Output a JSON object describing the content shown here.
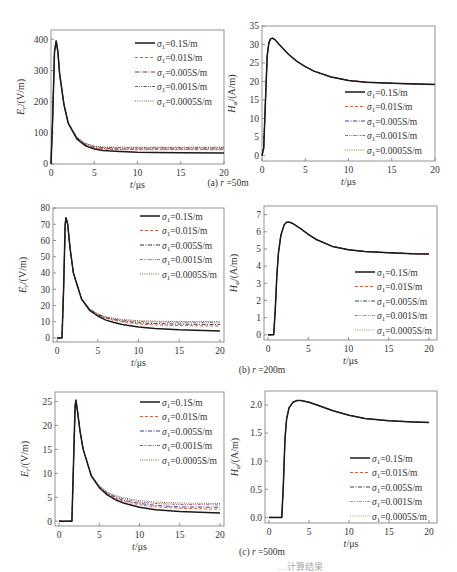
{
  "figure_caption_partial": "…计算结果",
  "chart_data": [
    {
      "id": "a-left",
      "type": "line",
      "row_caption": "(a) r=50m",
      "title": "",
      "xlabel": "t/μs",
      "ylabel": "E_r/(V/m)",
      "xlim": [
        0,
        20
      ],
      "ylim": [
        0,
        430
      ],
      "xticks": [
        0,
        5,
        10,
        15,
        20
      ],
      "yticks": [
        0,
        100,
        200,
        300,
        400
      ],
      "legend_position": "upper right",
      "grid": false,
      "series": [
        {
          "name": "σ1=0.1S/m",
          "style": "solid",
          "color": "#1a1a1a",
          "x": [
            0,
            0.2,
            0.4,
            0.6,
            0.8,
            1,
            1.5,
            2,
            3,
            4,
            5,
            6,
            8,
            10,
            12,
            15,
            20
          ],
          "y": [
            0,
            150,
            360,
            395,
            360,
            290,
            190,
            130,
            80,
            58,
            48,
            43,
            40,
            38,
            37,
            36,
            35
          ]
        },
        {
          "name": "σ1=0.01S/m",
          "style": "dashed",
          "color": "#e05a3a",
          "x": [
            0,
            0.2,
            0.4,
            0.6,
            0.8,
            1,
            1.5,
            2,
            3,
            4,
            5,
            6,
            8,
            10,
            12,
            15,
            20
          ],
          "y": [
            0,
            150,
            360,
            395,
            360,
            290,
            190,
            131,
            82,
            61,
            52,
            48,
            46,
            46,
            46,
            46,
            46
          ]
        },
        {
          "name": "σ1=0.005S/m",
          "style": "dashdot",
          "color": "#8b2a3a",
          "x": [
            0,
            0.2,
            0.4,
            0.6,
            0.8,
            1,
            1.5,
            2,
            3,
            4,
            5,
            6,
            8,
            10,
            12,
            15,
            20
          ],
          "y": [
            0,
            150,
            360,
            395,
            360,
            290,
            190,
            131,
            83,
            62,
            53,
            50,
            48,
            48,
            48,
            48,
            48
          ]
        },
        {
          "name": "σ1=0.001S/m",
          "style": "dashdotdot",
          "color": "#555577",
          "x": [
            0,
            0.2,
            0.4,
            0.6,
            0.8,
            1,
            1.5,
            2,
            3,
            4,
            5,
            6,
            8,
            10,
            12,
            15,
            20
          ],
          "y": [
            0,
            150,
            360,
            395,
            360,
            290,
            190,
            132,
            85,
            65,
            56,
            53,
            52,
            52,
            52,
            52,
            52
          ]
        },
        {
          "name": "σ1=0.0005S/m",
          "style": "dotted",
          "color": "#6b6b2a",
          "x": [
            0,
            0.2,
            0.4,
            0.6,
            0.8,
            1,
            1.5,
            2,
            3,
            4,
            5,
            6,
            8,
            10,
            12,
            15,
            20
          ],
          "y": [
            0,
            150,
            360,
            395,
            360,
            290,
            190,
            132,
            86,
            66,
            58,
            55,
            54,
            54,
            54,
            54,
            54
          ]
        }
      ]
    },
    {
      "id": "a-right",
      "type": "line",
      "row_caption": "(a) r=50m",
      "xlabel": "t/μs",
      "ylabel": "H_φ/(A/m)",
      "xlim": [
        0,
        20
      ],
      "ylim": [
        -1.5,
        35
      ],
      "xticks": [
        0,
        5,
        10,
        15,
        20
      ],
      "yticks": [
        0,
        5,
        10,
        15,
        20,
        25,
        30,
        35
      ],
      "legend_position": "lower right",
      "grid": false,
      "series": [
        {
          "name": "σ1=0.1S/m",
          "style": "solid",
          "color": "#1a1a1a",
          "x": [
            0,
            0.2,
            0.4,
            0.6,
            0.8,
            1,
            1.2,
            1.5,
            2,
            3,
            4,
            5,
            6,
            8,
            10,
            12,
            15,
            18,
            20
          ],
          "y": [
            0,
            2,
            15,
            27,
            30.5,
            31.5,
            31.7,
            31.3,
            30,
            27.5,
            25.5,
            24,
            22.8,
            21.2,
            20.3,
            19.8,
            19.5,
            19.3,
            19.2
          ]
        },
        {
          "name": "σ1=0.01S/m",
          "style": "dashed",
          "color": "#e05a3a",
          "same_as": "σ1=0.1S/m"
        },
        {
          "name": "σ1=0.005S/m",
          "style": "dashdot",
          "color": "#3a3a8b",
          "same_as": "σ1=0.1S/m"
        },
        {
          "name": "σ1=0.001S/m",
          "style": "dashdotdot",
          "color": "#9a5a9a",
          "same_as": "σ1=0.1S/m"
        },
        {
          "name": "σ1=0.0005S/m",
          "style": "dotted",
          "color": "#6b8b2a",
          "same_as": "σ1=0.1S/m"
        }
      ]
    },
    {
      "id": "b-left",
      "type": "line",
      "row_caption": "(b) r=200m",
      "xlabel": "t/μs",
      "ylabel": "E_r/(V/m)",
      "xlim": [
        -0.5,
        20.5
      ],
      "ylim": [
        -2.5,
        80
      ],
      "xticks": [
        0,
        5,
        10,
        15,
        20
      ],
      "yticks": [
        0,
        10,
        20,
        30,
        40,
        50,
        60,
        70,
        80
      ],
      "legend_position": "upper right",
      "grid": false,
      "series": [
        {
          "name": "σ1=0.1S/m",
          "style": "solid",
          "color": "#1a1a1a",
          "x": [
            0,
            0.6,
            0.8,
            1,
            1.1,
            1.3,
            1.6,
            2,
            3,
            4,
            5,
            6,
            7,
            8,
            10,
            12,
            15,
            20
          ],
          "y": [
            0,
            0,
            30,
            70,
            74,
            70,
            55,
            40,
            24,
            17,
            13.5,
            11,
            9.5,
            8.3,
            6.8,
            5.8,
            5,
            4.3
          ]
        },
        {
          "name": "σ1=0.01S/m",
          "style": "dashed",
          "color": "#e05a3a",
          "x": [
            0,
            0.6,
            0.8,
            1,
            1.1,
            1.3,
            1.6,
            2,
            3,
            4,
            5,
            6,
            7,
            8,
            10,
            12,
            15,
            20
          ],
          "y": [
            0,
            0,
            30,
            70,
            74,
            70,
            55,
            40,
            24,
            17.5,
            14,
            12,
            10.8,
            9.8,
            8.6,
            8,
            7.6,
            7.3
          ]
        },
        {
          "name": "σ1=0.005S/m",
          "style": "dashdot",
          "color": "#3a2a3a",
          "x": [
            0,
            0.6,
            0.8,
            1,
            1.1,
            1.3,
            1.6,
            2,
            3,
            4,
            5,
            6,
            7,
            8,
            10,
            12,
            15,
            20
          ],
          "y": [
            0,
            0,
            30,
            70,
            74,
            70,
            55,
            40,
            24,
            17.6,
            14.3,
            12.4,
            11.2,
            10.4,
            9.3,
            8.8,
            8.5,
            8.3
          ]
        },
        {
          "name": "σ1=0.001S/m",
          "style": "dashdotdot",
          "color": "#8a7a8a",
          "x": [
            0,
            0.6,
            0.8,
            1,
            1.1,
            1.3,
            1.6,
            2,
            3,
            4,
            5,
            6,
            7,
            8,
            10,
            12,
            15,
            20
          ],
          "y": [
            0,
            0,
            30,
            70,
            74,
            70,
            55,
            40,
            24.2,
            17.8,
            14.6,
            12.8,
            11.7,
            11,
            10.2,
            9.8,
            9.6,
            9.5
          ]
        },
        {
          "name": "σ1=0.0005S/m",
          "style": "dotted",
          "color": "#8b5a2a",
          "x": [
            0,
            0.6,
            0.8,
            1,
            1.1,
            1.3,
            1.6,
            2,
            3,
            4,
            5,
            6,
            7,
            8,
            10,
            12,
            15,
            20
          ],
          "y": [
            0,
            0,
            30,
            70,
            74,
            70,
            55,
            40,
            24.3,
            18,
            14.8,
            13,
            12,
            11.4,
            10.6,
            10.3,
            10.1,
            10
          ]
        }
      ]
    },
    {
      "id": "b-right",
      "type": "line",
      "row_caption": "(b) r=200m",
      "xlabel": "t/μs",
      "ylabel": "H_φ/(A/m)",
      "xlim": [
        -0.5,
        21
      ],
      "ylim": [
        -0.3,
        7.5
      ],
      "xticks": [
        0,
        5,
        10,
        15,
        20
      ],
      "yticks": [
        0,
        1,
        2,
        3,
        4,
        5,
        6,
        7
      ],
      "legend_position": "lower right",
      "grid": false,
      "series": [
        {
          "name": "σ1=0.1S/m",
          "style": "solid",
          "color": "#1a1a1a",
          "x": [
            0,
            0.7,
            0.9,
            1.1,
            1.3,
            1.6,
            2,
            2.3,
            2.7,
            3,
            4,
            5,
            6,
            8,
            10,
            12,
            15,
            18,
            20
          ],
          "y": [
            0,
            0,
            1.5,
            3.5,
            4.8,
            5.8,
            6.4,
            6.55,
            6.55,
            6.5,
            6.2,
            5.85,
            5.55,
            5.15,
            4.95,
            4.85,
            4.78,
            4.72,
            4.7
          ]
        },
        {
          "name": "σ1=0.01S/m",
          "style": "dashed",
          "color": "#e05a3a",
          "same_as": "σ1=0.1S/m"
        },
        {
          "name": "σ1=0.005S/m",
          "style": "dashdot",
          "color": "#2a4a4a",
          "same_as": "σ1=0.1S/m"
        },
        {
          "name": "σ1=0.001S/m",
          "style": "dashdotdot",
          "color": "#8a8a9a",
          "same_as": "σ1=0.1S/m"
        },
        {
          "name": "σ1=0.0005S/m",
          "style": "dotted",
          "color": "#c08a4a",
          "same_as": "σ1=0.1S/m"
        }
      ]
    },
    {
      "id": "c-left",
      "type": "line",
      "row_caption": "(c) r=500m",
      "xlabel": "t/μs",
      "ylabel": "E_r/(V/m)",
      "xlim": [
        -0.5,
        20.5
      ],
      "ylim": [
        -1,
        27
      ],
      "xticks": [
        0,
        5,
        10,
        15,
        20
      ],
      "yticks": [
        0,
        5,
        10,
        15,
        20,
        25
      ],
      "legend_position": "upper right",
      "grid": false,
      "series": [
        {
          "name": "σ1=0.1S/m",
          "style": "solid",
          "color": "#1a1a1a",
          "x": [
            0,
            1.6,
            1.8,
            2,
            2.1,
            2.3,
            2.6,
            3,
            4,
            5,
            6,
            7,
            8,
            10,
            12,
            15,
            20
          ],
          "y": [
            0,
            0,
            12,
            24,
            25.3,
            23,
            19,
            15,
            9.5,
            7,
            5.5,
            4.5,
            3.8,
            2.9,
            2.4,
            2,
            1.7
          ]
        },
        {
          "name": "σ1=0.01S/m",
          "style": "dashed",
          "color": "#e05a3a",
          "x": [
            0,
            1.6,
            1.8,
            2,
            2.1,
            2.3,
            2.6,
            3,
            4,
            5,
            6,
            7,
            8,
            10,
            12,
            15,
            20
          ],
          "y": [
            0,
            0,
            12,
            24,
            25.3,
            23,
            19,
            15,
            9.6,
            7.1,
            5.7,
            4.8,
            4.2,
            3.4,
            3,
            2.7,
            2.5
          ]
        },
        {
          "name": "σ1=0.005S/m",
          "style": "dashdot",
          "color": "#3a3a9a",
          "x": [
            0,
            1.6,
            1.8,
            2,
            2.1,
            2.3,
            2.6,
            3,
            4,
            5,
            6,
            7,
            8,
            10,
            12,
            15,
            20
          ],
          "y": [
            0,
            0,
            12,
            24,
            25.3,
            23,
            19,
            15,
            9.6,
            7.2,
            5.8,
            5,
            4.4,
            3.7,
            3.3,
            3,
            2.9
          ]
        },
        {
          "name": "σ1=0.001S/m",
          "style": "dashdotdot",
          "color": "#9a5a8a",
          "x": [
            0,
            1.6,
            1.8,
            2,
            2.1,
            2.3,
            2.6,
            3,
            4,
            5,
            6,
            7,
            8,
            10,
            12,
            15,
            20
          ],
          "y": [
            0,
            0,
            12,
            24,
            25.3,
            23,
            19,
            15,
            9.7,
            7.3,
            6,
            5.2,
            4.7,
            4,
            3.7,
            3.5,
            3.4
          ]
        },
        {
          "name": "σ1=0.0005S/m",
          "style": "dotted",
          "color": "#6b6b2a",
          "x": [
            0,
            1.6,
            1.8,
            2,
            2.1,
            2.3,
            2.6,
            3,
            4,
            5,
            6,
            7,
            8,
            10,
            12,
            15,
            20
          ],
          "y": [
            0,
            0,
            12,
            24,
            25.3,
            23,
            19,
            15,
            9.7,
            7.4,
            6.1,
            5.4,
            4.9,
            4.3,
            4,
            3.8,
            3.7
          ]
        }
      ]
    },
    {
      "id": "c-right",
      "type": "line",
      "row_caption": "(c) r=500m",
      "xlabel": "t/μs",
      "ylabel": "H_φ/(A/m)",
      "xlim": [
        -0.5,
        21
      ],
      "ylim": [
        -0.1,
        2.25
      ],
      "xticks": [
        0,
        5,
        10,
        15,
        20
      ],
      "yticks": [
        0.0,
        0.5,
        1.0,
        1.5,
        2.0
      ],
      "ytick_labels": [
        "0.0",
        "0.5",
        "1.0",
        "1.5",
        "2.0"
      ],
      "legend_position": "lower right",
      "grid": false,
      "series": [
        {
          "name": "σ1=0.1S/m",
          "style": "solid",
          "color": "#1a1a1a",
          "x": [
            0,
            1.6,
            1.8,
            2,
            2.2,
            2.5,
            3,
            3.5,
            4,
            5,
            6,
            8,
            10,
            12,
            15,
            18,
            20
          ],
          "y": [
            0,
            0,
            0.6,
            1.4,
            1.75,
            1.95,
            2.05,
            2.08,
            2.08,
            2.05,
            2.0,
            1.9,
            1.82,
            1.76,
            1.72,
            1.7,
            1.69
          ]
        },
        {
          "name": "σ1=0.01S/m",
          "style": "dashed",
          "color": "#e05a3a",
          "same_as": "σ1=0.1S/m"
        },
        {
          "name": "σ1=0.005S/m",
          "style": "dashdot",
          "color": "#2a4a3a",
          "same_as": "σ1=0.1S/m"
        },
        {
          "name": "σ1=0.001S/m",
          "style": "dashdotdot",
          "color": "#8a9a7a",
          "same_as": "σ1=0.1S/m"
        },
        {
          "name": "σ1=0.0005S/m",
          "style": "dotted",
          "color": "#c0a05a",
          "same_as": "σ1=0.1S/m"
        }
      ]
    }
  ],
  "layout": {
    "panels": [
      {
        "box": [
          51,
          30,
          224,
          164
        ],
        "legend": [
          135,
          43
        ],
        "caption_xy": [
          228,
          186
        ]
      },
      {
        "box": [
          262,
          26,
          435,
          161
        ],
        "legend": [
          345,
          92
        ],
        "caption_xy": null
      },
      {
        "box": [
          53,
          208,
          224,
          342
        ],
        "legend": [
          140,
          216
        ],
        "caption_xy": [
          262,
          373
        ]
      },
      {
        "box": [
          264,
          206,
          437,
          340
        ],
        "legend": [
          355,
          272
        ],
        "caption_xy": null
      },
      {
        "box": [
          55,
          392,
          224,
          526
        ],
        "legend": [
          140,
          402
        ],
        "caption_xy": [
          262,
          555
        ]
      },
      {
        "box": [
          265,
          391,
          437,
          523
        ],
        "legend": [
          350,
          458
        ],
        "caption_xy": null
      }
    ]
  }
}
